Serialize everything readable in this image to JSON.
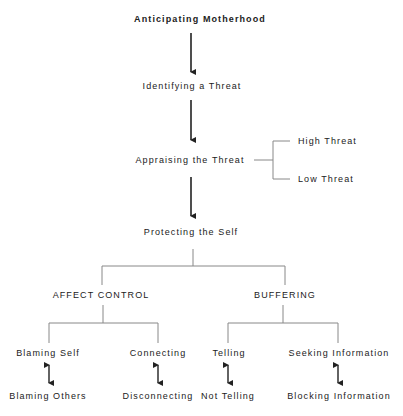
{
  "diagram": {
    "stages": [
      {
        "label": "Anticipating Motherhood"
      },
      {
        "label": "Identifying a Threat"
      },
      {
        "label": "Appraising the Threat"
      },
      {
        "label": "Protecting the Self"
      }
    ],
    "appraisal_branches": [
      {
        "label": "High Threat"
      },
      {
        "label": "Low Threat"
      }
    ],
    "strategies": [
      {
        "label": "AFFECT CONTROL",
        "pairs": [
          {
            "top": "Blaming Self",
            "bottom": "Blaming Others"
          },
          {
            "top": "Connecting",
            "bottom": "Disconnecting"
          }
        ]
      },
      {
        "label": "BUFFERING",
        "pairs": [
          {
            "top": "Telling",
            "bottom": "Not Telling"
          },
          {
            "top": "Seeking Information",
            "bottom": "Blocking Information"
          }
        ]
      }
    ],
    "colors": {
      "arrow": "#222222",
      "connector": "#888888",
      "text": "#222222"
    }
  }
}
